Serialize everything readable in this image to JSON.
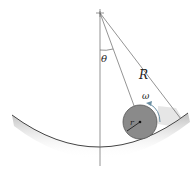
{
  "diagram": {
    "labels": {
      "theta": "θ",
      "R": "R",
      "omega": "ω",
      "r": "r"
    },
    "colors": {
      "line": "#555555",
      "disk": "#8a8a8a",
      "disk_edge": "#444444",
      "ground_shadow": "#cfcfcf",
      "omega_arrow": "#6b8fa3"
    }
  }
}
